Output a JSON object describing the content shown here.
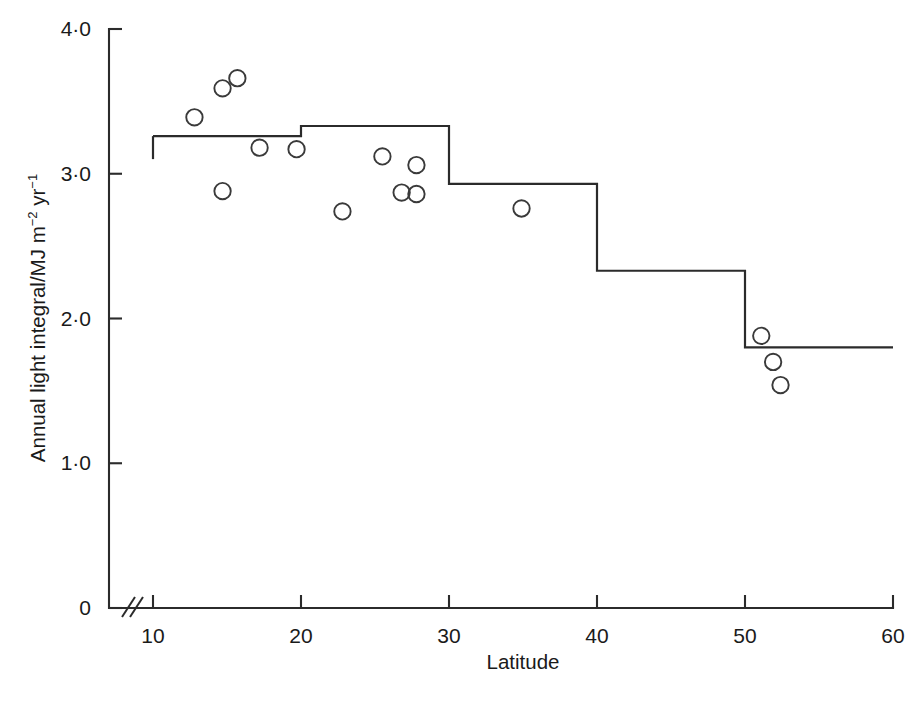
{
  "chart_data": {
    "type": "scatter",
    "title": "",
    "xlabel": "Latitude",
    "ylabel": "Annual light integral/MJ m⁻² yr⁻¹",
    "ylabel_parts": {
      "prefix": "Annual light integral/MJ m",
      "exp1": "−2",
      "mid": " yr",
      "exp2": "−1"
    },
    "xlim": [
      10,
      60
    ],
    "ylim": [
      0,
      4.0
    ],
    "grid": false,
    "legend": null,
    "axis_break": {
      "axis": "x",
      "between": [
        0,
        10
      ],
      "symbol": "double-slash"
    },
    "xticks": [
      10,
      20,
      30,
      40,
      50,
      60
    ],
    "xtick_labels": [
      "10",
      "20",
      "30",
      "40",
      "50",
      "60"
    ],
    "yticks": [
      0,
      1.0,
      2.0,
      3.0,
      4.0
    ],
    "ytick_labels": [
      "0",
      "1·0",
      "2·0",
      "3·0",
      "4·0"
    ],
    "series": [
      {
        "name": "Observed sites",
        "type": "scatter",
        "marker": "open-circle",
        "color": "#3a3a3a",
        "points": [
          {
            "x": 12.8,
            "y": 3.39
          },
          {
            "x": 14.7,
            "y": 2.88
          },
          {
            "x": 14.7,
            "y": 3.59
          },
          {
            "x": 15.7,
            "y": 3.66
          },
          {
            "x": 17.2,
            "y": 3.18
          },
          {
            "x": 19.7,
            "y": 3.17
          },
          {
            "x": 22.8,
            "y": 2.74
          },
          {
            "x": 25.5,
            "y": 3.12
          },
          {
            "x": 26.8,
            "y": 2.87
          },
          {
            "x": 27.8,
            "y": 3.06
          },
          {
            "x": 27.8,
            "y": 2.86
          },
          {
            "x": 34.9,
            "y": 2.76
          },
          {
            "x": 51.1,
            "y": 1.88
          },
          {
            "x": 51.9,
            "y": 1.7
          },
          {
            "x": 52.4,
            "y": 1.54
          }
        ]
      },
      {
        "name": "Latitude band mean",
        "type": "step",
        "color": "#2b2b2b",
        "bands": [
          {
            "x_start": 10,
            "x_end": 20,
            "value": 3.26
          },
          {
            "x_start": 20,
            "x_end": 30,
            "value": 3.33
          },
          {
            "x_start": 30,
            "x_end": 40,
            "value": 2.93
          },
          {
            "x_start": 40,
            "x_end": 50,
            "value": 2.33
          },
          {
            "x_start": 50,
            "x_end": 60,
            "value": 1.8
          }
        ]
      }
    ]
  }
}
